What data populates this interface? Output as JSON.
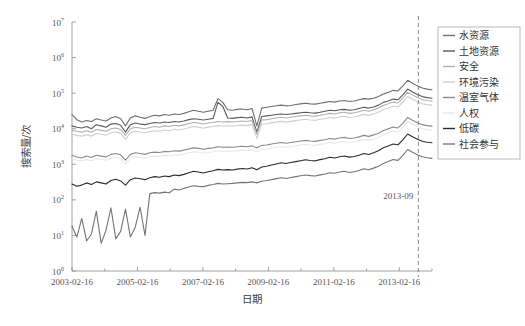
{
  "chart_data": {
    "type": "line",
    "title": "",
    "xlabel": "日期",
    "ylabel": "搜索量/次",
    "yscale": "log",
    "ylim": [
      1,
      10000000
    ],
    "ytick_labels": [
      "10^0",
      "10^1",
      "10^2",
      "10^3",
      "10^4",
      "10^5",
      "10^6",
      "10^7"
    ],
    "ytick_bases": [
      "10",
      "10",
      "10",
      "10",
      "10",
      "10",
      "10",
      "10"
    ],
    "ytick_exponents": [
      "0",
      "1",
      "2",
      "3",
      "4",
      "5",
      "6",
      "7"
    ],
    "xtick_labels": [
      "2003-02-16",
      "2005-02-16",
      "2007-02-16",
      "2009-02-16",
      "2011-02-16",
      "2013-02-16"
    ],
    "xlim": [
      "2003-02-16",
      "2014-02-16"
    ],
    "grid": false,
    "legend_position": "right-outside-top",
    "annotations": [
      {
        "text": "2013-09",
        "type": "vertical-dashed-line",
        "x": "2013-09"
      }
    ],
    "series": [
      {
        "name": "水资源",
        "color": "#6e6e6e",
        "values": [
          25000,
          18000,
          15500,
          17000,
          16000,
          19000,
          17500,
          16500,
          20000,
          22000,
          19000,
          12000,
          20000,
          23000,
          21000,
          19500,
          22000,
          24000,
          23000,
          25000,
          24000,
          26000,
          25000,
          27000,
          30000,
          33000,
          31000,
          29000,
          31000,
          33000,
          70000,
          55000,
          34000,
          33000,
          35000,
          36000,
          34000,
          37000,
          12000,
          38000,
          40000,
          42000,
          44000,
          46000,
          44000,
          45000,
          48000,
          50000,
          52000,
          50000,
          49000,
          52000,
          55000,
          58000,
          56000,
          60000,
          62000,
          58000,
          60000,
          65000,
          70000,
          68000,
          72000,
          80000,
          95000,
          105000,
          120000,
          115000,
          160000,
          230000,
          190000,
          160000,
          140000,
          130000,
          125000
        ]
      },
      {
        "name": "土地资源",
        "color": "#5a5a5a",
        "values": [
          12000,
          11000,
          10500,
          11500,
          10000,
          13000,
          12000,
          11000,
          13500,
          14000,
          12500,
          8000,
          13000,
          14500,
          13500,
          13000,
          14000,
          15000,
          14500,
          15500,
          15000,
          16000,
          15500,
          16500,
          18000,
          19000,
          18500,
          17500,
          18500,
          19500,
          55000,
          42000,
          20000,
          19500,
          20500,
          21000,
          20000,
          21500,
          8000,
          22000,
          23000,
          24000,
          25000,
          26000,
          25000,
          26000,
          27000,
          28000,
          29000,
          28000,
          27500,
          29000,
          31000,
          33000,
          32000,
          34000,
          35000,
          33000,
          34000,
          37000,
          40000,
          38000,
          41000,
          46000,
          55000,
          60000,
          68000,
          65000,
          90000,
          130000,
          108000,
          92000,
          80000,
          75000,
          72000
        ]
      },
      {
        "name": "安全",
        "color": "#b0b0b0",
        "values": [
          9000,
          8500,
          8000,
          8800,
          8000,
          9500,
          9000,
          8500,
          10000,
          10500,
          9500,
          6500,
          10000,
          11000,
          10500,
          10000,
          10800,
          11500,
          11000,
          12000,
          11500,
          12500,
          12000,
          12800,
          14000,
          15000,
          14500,
          13500,
          14500,
          15000,
          16000,
          15500,
          15800,
          15500,
          16000,
          16500,
          16000,
          17000,
          7000,
          17500,
          18000,
          19000,
          20000,
          21000,
          20000,
          21000,
          22000,
          23000,
          24000,
          23000,
          22500,
          24000,
          25000,
          27000,
          26000,
          28000,
          29000,
          27000,
          28000,
          30000,
          33000,
          31000,
          34000,
          38000,
          45000,
          50000,
          56000,
          53000,
          72000,
          105000,
          88000,
          75000,
          66000,
          62000,
          60000
        ]
      },
      {
        "name": "环境污染",
        "color": "#cfcfcf",
        "values": [
          7000,
          6500,
          6200,
          6800,
          6200,
          7300,
          7000,
          6600,
          7700,
          8100,
          7400,
          5000,
          7700,
          8500,
          8100,
          7700,
          8300,
          8800,
          8500,
          9200,
          8800,
          9600,
          9200,
          9800,
          10700,
          11500,
          11100,
          10300,
          11100,
          11500,
          12200,
          11900,
          12100,
          11900,
          12200,
          12600,
          12200,
          13000,
          5400,
          13400,
          13800,
          14600,
          15300,
          16100,
          15300,
          16100,
          16900,
          17600,
          18400,
          17600,
          17200,
          18400,
          19100,
          20700,
          19900,
          21400,
          22200,
          20700,
          21400,
          23000,
          25300,
          23700,
          26000,
          29100,
          34500,
          38300,
          42900,
          40600,
          55200,
          80500,
          67400,
          57500,
          50600,
          47500,
          46000
        ]
      },
      {
        "name": "温室气体",
        "color": "#8a8a8a",
        "values": [
          1800,
          1600,
          1500,
          1700,
          1550,
          1800,
          1700,
          1600,
          1900,
          2000,
          1850,
          1300,
          1900,
          2100,
          2000,
          1900,
          2100,
          2200,
          2150,
          2300,
          2250,
          2400,
          2350,
          2500,
          2700,
          2900,
          2800,
          2650,
          2800,
          2900,
          3100,
          3000,
          3050,
          3000,
          3100,
          3200,
          3100,
          3300,
          2900,
          3400,
          3500,
          3700,
          3900,
          4100,
          3900,
          4100,
          4300,
          4500,
          4700,
          4500,
          4400,
          4700,
          4900,
          5300,
          5100,
          5500,
          5700,
          5300,
          5500,
          5900,
          6500,
          6100,
          6700,
          7500,
          8900,
          9900,
          11100,
          10500,
          14200,
          20700,
          17300,
          14800,
          13000,
          12200,
          11800
        ]
      },
      {
        "name": "人权",
        "color": "#e8e8e8",
        "values": [
          1400,
          1300,
          1250,
          1350,
          1260,
          1430,
          1380,
          1300,
          1480,
          1560,
          1440,
          1020,
          1490,
          1620,
          1560,
          1490,
          1620,
          1700,
          1660,
          1780,
          1740,
          1850,
          1810,
          1930,
          2090,
          2240,
          2170,
          2050,
          2170,
          2240,
          2390,
          2320,
          2360,
          2320,
          2390,
          2470,
          2390,
          2550,
          2240,
          2620,
          2700,
          2860,
          3010,
          3170,
          3010,
          3170,
          3320,
          3470,
          3630,
          3470,
          3400,
          3630,
          3780,
          4090,
          3940,
          4240,
          4400,
          4090,
          4240,
          4550,
          5010,
          4700,
          5170,
          5790,
          6870,
          7640,
          8570,
          8100,
          10960,
          15970,
          13350,
          11420,
          10030,
          9410,
          9100
        ]
      },
      {
        "name": "低碳",
        "color": "#2b2b2b",
        "values": [
          280,
          240,
          260,
          300,
          270,
          320,
          300,
          280,
          350,
          380,
          340,
          260,
          370,
          410,
          390,
          370,
          420,
          450,
          430,
          470,
          450,
          500,
          480,
          520,
          580,
          640,
          610,
          570,
          620,
          660,
          720,
          690,
          710,
          690,
          730,
          760,
          740,
          800,
          700,
          840,
          880,
          950,
          1020,
          1100,
          1050,
          1120,
          1190,
          1260,
          1340,
          1280,
          1250,
          1350,
          1430,
          1570,
          1500,
          1630,
          1710,
          1590,
          1660,
          1800,
          2020,
          1890,
          2110,
          2400,
          2900,
          3280,
          3720,
          3530,
          4830,
          7100,
          5920,
          5050,
          4430,
          4160,
          4020
        ]
      },
      {
        "name": "社会参与",
        "color": "#747474",
        "values": [
          18,
          9,
          30,
          7,
          11,
          48,
          6,
          14,
          60,
          8,
          13,
          55,
          9,
          17,
          62,
          10,
          150,
          160,
          155,
          165,
          158,
          200,
          190,
          210,
          230,
          250,
          240,
          235,
          255,
          270,
          290,
          280,
          285,
          290,
          300,
          310,
          305,
          320,
          300,
          335,
          350,
          370,
          395,
          420,
          400,
          425,
          450,
          475,
          500,
          480,
          470,
          505,
          535,
          580,
          560,
          605,
          635,
          590,
          615,
          665,
          745,
          700,
          780,
          880,
          1060,
          1200,
          1360,
          1290,
          1770,
          2600,
          2170,
          1850,
          1620,
          1520,
          1470
        ]
      }
    ]
  },
  "legend": {
    "items": [
      {
        "label": "水资源"
      },
      {
        "label": "土地资源"
      },
      {
        "label": "安全"
      },
      {
        "label": "环境污染"
      },
      {
        "label": "温室气体"
      },
      {
        "label": "人权"
      },
      {
        "label": "低碳"
      },
      {
        "label": "社会参与"
      }
    ]
  }
}
